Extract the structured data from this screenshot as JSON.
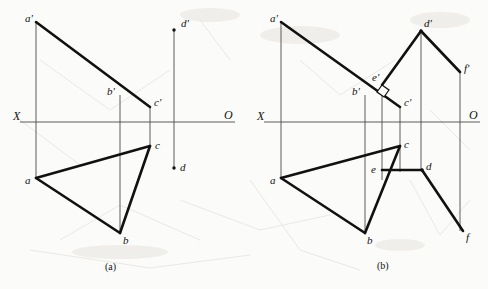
{
  "figure": {
    "type": "descriptive-geometry-projection-drawing",
    "colors": {
      "ink": "#111111",
      "thin_line": "#555555",
      "paper": "#fbfbf9"
    },
    "captions": [
      {
        "text": "(a)",
        "x": 113,
        "y": 265
      },
      {
        "text": "(b)",
        "x": 385,
        "y": 264
      }
    ],
    "panels": [
      {
        "id": "a",
        "caption": "(a)",
        "axis": {
          "x_label": "X",
          "o_label": "O",
          "x_label_pos": [
            13,
            110
          ],
          "o_label_pos": [
            224,
            109
          ],
          "y": 122,
          "x_start": 20,
          "x_end": 235
        },
        "points": [
          {
            "name": "a'",
            "x": 36,
            "y": 22,
            "lx": 25,
            "ly": 13,
            "dot": false
          },
          {
            "name": "b'",
            "x": 120,
            "y": 95,
            "lx": 107,
            "ly": 86,
            "dot": false
          },
          {
            "name": "c'",
            "x": 150,
            "y": 107,
            "lx": 154,
            "ly": 97,
            "dot": false
          },
          {
            "name": "d'",
            "x": 174,
            "y": 30,
            "lx": 181,
            "ly": 18,
            "dot": true
          },
          {
            "name": "a",
            "x": 36,
            "y": 178,
            "lx": 25,
            "ly": 175,
            "dot": false
          },
          {
            "name": "b",
            "x": 120,
            "y": 233,
            "lx": 123,
            "ly": 235,
            "dot": false
          },
          {
            "name": "c",
            "x": 150,
            "y": 146,
            "lx": 155,
            "ly": 140,
            "dot": false
          },
          {
            "name": "d",
            "x": 174,
            "y": 168,
            "lx": 180,
            "ly": 162,
            "dot": true
          }
        ],
        "thick_segments": [
          {
            "from": "a'",
            "to": "c'"
          },
          {
            "from": "a",
            "to": "c"
          },
          {
            "from": "a",
            "to": "b"
          },
          {
            "from": "b",
            "to": "c"
          }
        ],
        "thin_segments": [
          {
            "from": [
              36,
              22
            ],
            "to": [
              36,
              178
            ]
          },
          {
            "from": [
              120,
              95
            ],
            "to": [
              120,
              233
            ]
          },
          {
            "from": [
              150,
              107
            ],
            "to": [
              150,
              146
            ]
          },
          {
            "from": [
              174,
              30
            ],
            "to": [
              174,
              168
            ]
          }
        ]
      },
      {
        "id": "b",
        "caption": "(b)",
        "axis": {
          "x_label": "X",
          "o_label": "O",
          "x_label_pos": [
            257,
            110
          ],
          "o_label_pos": [
            469,
            109
          ],
          "y": 122,
          "x_start": 264,
          "x_end": 480
        },
        "points": [
          {
            "name": "a'",
            "x": 281,
            "y": 22,
            "lx": 270,
            "ly": 13,
            "dot": false
          },
          {
            "name": "b'",
            "x": 365,
            "y": 95,
            "lx": 352,
            "ly": 86,
            "dot": false
          },
          {
            "name": "e'",
            "x": 382,
            "y": 85,
            "lx": 372,
            "ly": 74,
            "dot": false
          },
          {
            "name": "c'",
            "x": 400,
            "y": 107,
            "lx": 404,
            "ly": 97,
            "dot": false
          },
          {
            "name": "d'",
            "x": 421,
            "y": 31,
            "lx": 424,
            "ly": 18,
            "dot": true
          },
          {
            "name": "f'",
            "x": 460,
            "y": 72,
            "lx": 464,
            "ly": 63,
            "dot": false
          },
          {
            "name": "a",
            "x": 281,
            "y": 178,
            "lx": 270,
            "ly": 175,
            "dot": false
          },
          {
            "name": "b",
            "x": 365,
            "y": 233,
            "lx": 367,
            "ly": 235,
            "dot": false
          },
          {
            "name": "e",
            "x": 388,
            "y": 170,
            "lx": 372,
            "ly": 165,
            "dot": false
          },
          {
            "name": "c",
            "x": 400,
            "y": 146,
            "lx": 404,
            "ly": 139,
            "dot": false
          },
          {
            "name": "d",
            "x": 422,
            "y": 170,
            "lx": 426,
            "ly": 161,
            "dot": true
          },
          {
            "name": "f",
            "x": 463,
            "y": 231,
            "lx": 466,
            "ly": 233,
            "dot": false
          }
        ],
        "thick_segments": [
          {
            "from": "a'",
            "to": "c'",
            "note": "triangle-front-upper-edge-through-e-prime"
          },
          {
            "from": "d'",
            "to": "e'",
            "note": "line-de-front-view-left-branch"
          },
          {
            "from": "d'",
            "to": "f'",
            "note": "line-df-front-view-right-branch"
          },
          {
            "from": "a",
            "to": "c"
          },
          {
            "from": "a",
            "to": "b"
          },
          {
            "from": "b",
            "to": "c"
          },
          {
            "from": "e",
            "to": "d",
            "note": "line-de-top-view"
          },
          {
            "from": "d",
            "to": "f",
            "note": "line-df-top-view"
          }
        ],
        "thin_segments": [
          {
            "from": [
              281,
              22
            ],
            "to": [
              281,
              178
            ]
          },
          {
            "from": [
              365,
              95
            ],
            "to": [
              365,
              233
            ]
          },
          {
            "from": [
              400,
              107
            ],
            "to": [
              400,
              170
            ]
          },
          {
            "from": [
              421,
              31
            ],
            "to": [
              421,
              170
            ]
          },
          {
            "from": [
              460,
              72
            ],
            "to": [
              460,
              231
            ]
          },
          {
            "from": [
              382,
              85
            ],
            "to": [
              382,
              180
            ]
          }
        ],
        "right_angle_marker": {
          "at": "e'",
          "x": 382,
          "y": 85,
          "size": 8,
          "label": "perpendicular-mark"
        }
      }
    ]
  }
}
